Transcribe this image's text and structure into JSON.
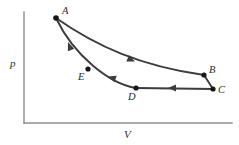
{
  "figure": {
    "kind": "pv-diagram",
    "background_color": "#ffffff",
    "ink_color": "#3b3b40",
    "axis_color": "#8d8d93",
    "dot_color": "#16161a"
  },
  "axes": {
    "y_label": "p",
    "x_label": "V",
    "y_axis": {
      "x": 24,
      "y_top": 12,
      "y_bottom": 123
    },
    "x_axis": {
      "y": 123,
      "x_left": 24,
      "x_right": 232
    },
    "y_label_pos": {
      "x": 10,
      "y": 67
    },
    "x_label_pos": {
      "x": 124,
      "y": 138
    }
  },
  "states": [
    {
      "id": "A",
      "label": "A",
      "x": 56,
      "y": 18,
      "label_x": 62,
      "label_y": 14
    },
    {
      "id": "B",
      "label": "B",
      "x": 204,
      "y": 75,
      "label_x": 209,
      "label_y": 73
    },
    {
      "id": "C",
      "label": "C",
      "x": 213,
      "y": 89,
      "label_x": 218,
      "label_y": 92
    },
    {
      "id": "D",
      "label": "D",
      "x": 136,
      "y": 88,
      "label_x": 128,
      "label_y": 100
    },
    {
      "id": "E",
      "label": "E",
      "x": 88,
      "y": 69,
      "label_x": 78,
      "label_y": 80
    }
  ],
  "processes": [
    {
      "id": "A-to-B",
      "from": "A",
      "to": "B",
      "shape": "curve",
      "direction": "forward",
      "path": "M 56 18 C 96 46 140 66 204 75",
      "arrow": {
        "x": 133,
        "y": 61,
        "angle": 23
      }
    },
    {
      "id": "B-to-C",
      "from": "B",
      "to": "C",
      "shape": "line",
      "direction": "forward",
      "path": "M 204 75 L 213 89",
      "arrow": null
    },
    {
      "id": "C-to-D",
      "from": "C",
      "to": "D",
      "shape": "line",
      "direction": "backward",
      "path": "M 213 89 L 136 88",
      "arrow": {
        "x": 172,
        "y": 88,
        "angle": 180
      }
    },
    {
      "id": "D-to-E-to-A",
      "from": "D",
      "to": "A",
      "shape": "curve",
      "direction": "backward",
      "path": "M 136 88 C 110 84 74 56 56 18",
      "arrow_mid": {
        "x": 110,
        "y": 77,
        "angle": 198
      },
      "arrow_near_a": {
        "x": 69,
        "y": 44,
        "angle": 249
      }
    }
  ],
  "dot_radius": 2.6
}
